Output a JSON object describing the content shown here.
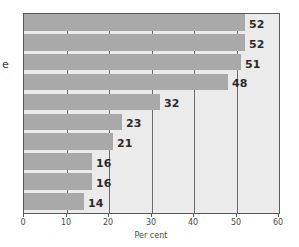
{
  "chart_data": {
    "type": "bar",
    "orientation": "horizontal",
    "title": "",
    "xlabel": "Per cent",
    "ylabel": "e",
    "xlim": [
      0,
      60
    ],
    "xticks": [
      0,
      10,
      20,
      30,
      40,
      50,
      60
    ],
    "grid": true,
    "legend": "none",
    "categories": [
      "",
      "",
      "",
      "",
      "",
      "",
      "",
      "",
      "",
      ""
    ],
    "values": [
      52,
      52,
      51,
      48,
      32,
      23,
      21,
      16,
      16,
      14
    ],
    "data_labels": [
      "52",
      "52",
      "51",
      "48",
      "32",
      "23",
      "21",
      "16",
      "16",
      "14"
    ],
    "bar_color": "#a9a9a9",
    "plot_background": "#ebebeb",
    "gridline_color": "#6b6b6b",
    "axis_color": "#5a5a5a",
    "label_color": "#2b2b2b"
  },
  "axis": {
    "tick_labels": [
      "0",
      "10",
      "20",
      "30",
      "40",
      "50",
      "60"
    ],
    "title": "Per cent"
  },
  "side_label": {
    "text": "e"
  }
}
